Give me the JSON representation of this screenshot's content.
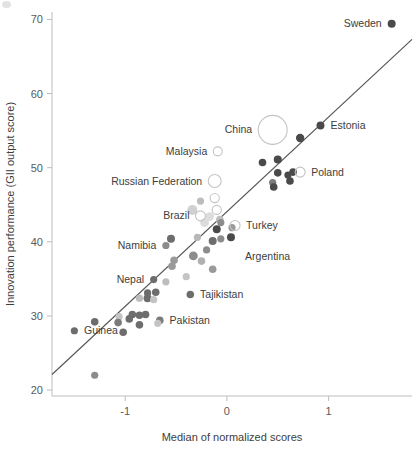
{
  "chart_data": {
    "type": "scatter",
    "title": "",
    "xlabel": "Median of normalized scores",
    "ylabel": "Innovation performance (GII output score)",
    "xlim": [
      -1.72,
      1.82
    ],
    "ylim": [
      19.2,
      71.0
    ],
    "xticks": [
      -1,
      0,
      1
    ],
    "xtick_labels": [
      "-1",
      "0",
      "1"
    ],
    "yticks": [
      20,
      30,
      40,
      50,
      60,
      70
    ],
    "ytick_labels": [
      "20",
      "30",
      "40",
      "50",
      "60",
      "70"
    ],
    "grid": false,
    "legend": "none",
    "trend_line": {
      "label": "linear fit",
      "x_start": -1.72,
      "y_start": 22.1,
      "x_end": 1.82,
      "y_end": 67.3,
      "color": "#555555"
    },
    "marker_styles": {
      "filled_dark": "#4a4a4a",
      "filled_mid": "#8c8c8c",
      "filled_light": "#c9c9c9",
      "filled_pale": "#e0e0e0",
      "hollow_stroke": "#c4c4c4"
    },
    "labeled_points": [
      {
        "name": "Sweden",
        "x": 1.62,
        "y": 69.4,
        "r": 4.0,
        "fill": "#4a4a4a",
        "hollow": false,
        "label_side": "left"
      },
      {
        "name": "Estonia",
        "x": 0.92,
        "y": 55.7,
        "r": 4.0,
        "fill": "#4a4a4a",
        "hollow": false,
        "label_side": "right"
      },
      {
        "name": "China",
        "x": 0.45,
        "y": 55.1,
        "r": 14.5,
        "fill": "none",
        "hollow": true,
        "label_side": "left"
      },
      {
        "name": "Poland",
        "x": 0.72,
        "y": 49.4,
        "r": 5.0,
        "fill": "none",
        "hollow": true,
        "label_side": "right"
      },
      {
        "name": "Malaysia",
        "x": -0.09,
        "y": 52.2,
        "r": 4.5,
        "fill": "none",
        "hollow": true,
        "label_side": "left"
      },
      {
        "name": "Russian Federation",
        "x": -0.12,
        "y": 48.2,
        "r": 6.5,
        "fill": "none",
        "hollow": true,
        "label_side": "left"
      },
      {
        "name": "Brazil",
        "x": -0.26,
        "y": 43.5,
        "r": 5.0,
        "fill": "none",
        "hollow": true,
        "label_side": "left"
      },
      {
        "name": "Turkey",
        "x": 0.08,
        "y": 42.2,
        "r": 5.0,
        "fill": "none",
        "hollow": true,
        "label_side": "right"
      },
      {
        "name": "Namibia",
        "x": -0.6,
        "y": 39.5,
        "r": 3.6,
        "fill": "#8c8c8c",
        "hollow": false,
        "label_side": "left"
      },
      {
        "name": "Argentina",
        "x": 0.12,
        "y": 38.0,
        "r": 0.0,
        "fill": "none",
        "hollow": false,
        "label_side": "right"
      },
      {
        "name": "Nepal",
        "x": -0.72,
        "y": 34.9,
        "r": 3.6,
        "fill": "#6d6d6d",
        "hollow": false,
        "label_side": "left"
      },
      {
        "name": "Tajikistan",
        "x": -0.36,
        "y": 32.9,
        "r": 3.8,
        "fill": "#6d6d6d",
        "hollow": false,
        "label_side": "right"
      },
      {
        "name": "Pakistan",
        "x": -0.66,
        "y": 29.4,
        "r": 3.8,
        "fill": "#7b7b7b",
        "hollow": false,
        "label_side": "right"
      },
      {
        "name": "Guinea",
        "x": -1.5,
        "y": 28.0,
        "r": 3.6,
        "fill": "#6d6d6d",
        "hollow": false,
        "label_side": "right"
      }
    ],
    "points": [
      {
        "x": 1.62,
        "y": 69.4,
        "r": 4.0,
        "fill": "#4a4a4a"
      },
      {
        "x": 0.92,
        "y": 55.7,
        "r": 4.0,
        "fill": "#4a4a4a"
      },
      {
        "x": 0.72,
        "y": 54.0,
        "r": 4.2,
        "fill": "#4a4a4a"
      },
      {
        "x": 0.5,
        "y": 51.1,
        "r": 4.0,
        "fill": "#4a4a4a"
      },
      {
        "x": 0.35,
        "y": 50.7,
        "r": 3.8,
        "fill": "#4a4a4a"
      },
      {
        "x": 0.5,
        "y": 49.3,
        "r": 3.8,
        "fill": "#4a4a4a"
      },
      {
        "x": 0.65,
        "y": 49.4,
        "r": 3.8,
        "fill": "#4a4a4a"
      },
      {
        "x": 0.6,
        "y": 49.0,
        "r": 3.6,
        "fill": "#4a4a4a"
      },
      {
        "x": 0.62,
        "y": 48.2,
        "r": 3.8,
        "fill": "#4a4a4a"
      },
      {
        "x": 0.45,
        "y": 48.0,
        "r": 3.6,
        "fill": "#7b7b7b"
      },
      {
        "x": 0.46,
        "y": 47.4,
        "r": 3.8,
        "fill": "#4a4a4a"
      },
      {
        "x": -0.26,
        "y": 45.5,
        "r": 3.6,
        "fill": "#bdbdbd"
      },
      {
        "x": -0.12,
        "y": 45.9,
        "r": 4.6,
        "fill": "none"
      },
      {
        "x": -0.34,
        "y": 44.3,
        "r": 5.0,
        "fill": "#d0d0d0"
      },
      {
        "x": -0.1,
        "y": 44.3,
        "r": 4.6,
        "fill": "none"
      },
      {
        "x": -0.17,
        "y": 43.4,
        "r": 4.4,
        "fill": "#dcdcdc"
      },
      {
        "x": -0.07,
        "y": 43.0,
        "r": 3.8,
        "fill": "#c0c0c0"
      },
      {
        "x": -0.22,
        "y": 42.6,
        "r": 4.4,
        "fill": "#dcdcdc"
      },
      {
        "x": -0.06,
        "y": 42.6,
        "r": 3.6,
        "fill": "#8c8c8c"
      },
      {
        "x": -0.1,
        "y": 41.7,
        "r": 4.0,
        "fill": "#4a4a4a"
      },
      {
        "x": 0.05,
        "y": 41.9,
        "r": 3.6,
        "fill": "#9a9a9a"
      },
      {
        "x": -0.29,
        "y": 40.6,
        "r": 3.6,
        "fill": "#b8b8b8"
      },
      {
        "x": -0.55,
        "y": 40.4,
        "r": 4.0,
        "fill": "#6d6d6d"
      },
      {
        "x": -0.14,
        "y": 40.1,
        "r": 4.0,
        "fill": "#6d6d6d"
      },
      {
        "x": -0.06,
        "y": 40.4,
        "r": 3.6,
        "fill": "#8c8c8c"
      },
      {
        "x": 0.04,
        "y": 40.6,
        "r": 4.0,
        "fill": "#4a4a4a"
      },
      {
        "x": -0.6,
        "y": 39.5,
        "r": 3.6,
        "fill": "#8c8c8c"
      },
      {
        "x": -0.2,
        "y": 38.9,
        "r": 3.6,
        "fill": "#8c8c8c"
      },
      {
        "x": -0.33,
        "y": 38.1,
        "r": 4.4,
        "fill": "#8c8c8c"
      },
      {
        "x": -0.52,
        "y": 37.5,
        "r": 3.8,
        "fill": "#9a9a9a"
      },
      {
        "x": -0.25,
        "y": 37.4,
        "r": 3.8,
        "fill": "#b0b0b0"
      },
      {
        "x": -0.54,
        "y": 36.7,
        "r": 3.8,
        "fill": "#9a9a9a"
      },
      {
        "x": -0.14,
        "y": 36.3,
        "r": 3.8,
        "fill": "#9a9a9a"
      },
      {
        "x": -0.4,
        "y": 35.3,
        "r": 3.6,
        "fill": "#c4c4c4"
      },
      {
        "x": -0.72,
        "y": 34.9,
        "r": 3.6,
        "fill": "#6d6d6d"
      },
      {
        "x": -0.6,
        "y": 34.6,
        "r": 3.6,
        "fill": "#bdbdbd"
      },
      {
        "x": -0.86,
        "y": 32.4,
        "r": 3.6,
        "fill": "#bdbdbd"
      },
      {
        "x": -0.78,
        "y": 33.1,
        "r": 3.6,
        "fill": "#6d6d6d"
      },
      {
        "x": -0.7,
        "y": 33.2,
        "r": 3.8,
        "fill": "#6d6d6d"
      },
      {
        "x": -0.78,
        "y": 32.4,
        "r": 4.0,
        "fill": "#6d6d6d"
      },
      {
        "x": -0.72,
        "y": 32.2,
        "r": 3.6,
        "fill": "#c4c4c4"
      },
      {
        "x": -0.36,
        "y": 32.9,
        "r": 3.8,
        "fill": "#6d6d6d"
      },
      {
        "x": -0.93,
        "y": 30.2,
        "r": 3.8,
        "fill": "#6d6d6d"
      },
      {
        "x": -0.86,
        "y": 30.1,
        "r": 3.8,
        "fill": "#6d6d6d"
      },
      {
        "x": -0.8,
        "y": 30.2,
        "r": 3.8,
        "fill": "#6d6d6d"
      },
      {
        "x": -1.06,
        "y": 29.9,
        "r": 3.6,
        "fill": "#c4c4c4"
      },
      {
        "x": -0.96,
        "y": 29.6,
        "r": 3.8,
        "fill": "#6d6d6d"
      },
      {
        "x": -0.66,
        "y": 29.4,
        "r": 3.8,
        "fill": "#7b7b7b"
      },
      {
        "x": -0.68,
        "y": 29.0,
        "r": 3.6,
        "fill": "#c4c4c4"
      },
      {
        "x": -1.3,
        "y": 29.2,
        "r": 3.8,
        "fill": "#6d6d6d"
      },
      {
        "x": -1.07,
        "y": 29.1,
        "r": 3.8,
        "fill": "#7b7b7b"
      },
      {
        "x": -0.86,
        "y": 28.8,
        "r": 3.8,
        "fill": "#6d6d6d"
      },
      {
        "x": -1.5,
        "y": 28.0,
        "r": 3.6,
        "fill": "#6d6d6d"
      },
      {
        "x": -1.02,
        "y": 27.8,
        "r": 3.8,
        "fill": "#6d6d6d"
      },
      {
        "x": -1.3,
        "y": 22.0,
        "r": 3.6,
        "fill": "#8c8c8c"
      }
    ]
  },
  "axes": {
    "x_axis_name": "x-axis",
    "y_axis_name": "y-axis"
  }
}
